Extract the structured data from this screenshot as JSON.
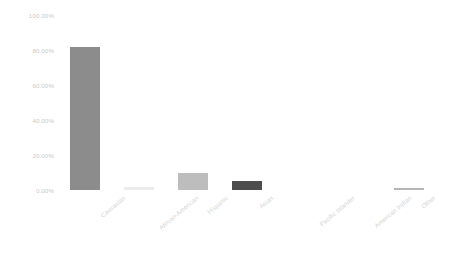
{
  "chart_data": {
    "type": "bar",
    "title": "",
    "subtitle": "",
    "xlabel": "",
    "ylabel": "",
    "categories": [
      "Caucasian",
      "African-American",
      "Hispanic",
      "Asian",
      "Pacific Islander",
      "American Indian",
      "Other"
    ],
    "values": [
      82.0,
      2.0,
      9.5,
      5.0,
      0.0,
      0.0,
      1.0
    ],
    "value_labels": [
      "82.00%",
      "2.00%",
      "9.50%",
      "5.00%",
      "0.00%",
      "0.00%",
      "1.00%"
    ],
    "ylim": [
      0,
      100
    ],
    "ytick_values": [
      0,
      20,
      40,
      60,
      80,
      100
    ],
    "ytick_labels": [
      "0.00%",
      "20.00%",
      "40.00%",
      "60.00%",
      "80.00%",
      "100.00%"
    ],
    "grid": false,
    "legend": "none",
    "legend_position": "none",
    "bar_colors": [
      "#8c8c8c",
      "#ececec",
      "#bdbdbd",
      "#4d4d4d",
      "#ffffff",
      "#ffffff",
      "#b5b5b5"
    ],
    "axis_label_color": "#cccccc"
  }
}
